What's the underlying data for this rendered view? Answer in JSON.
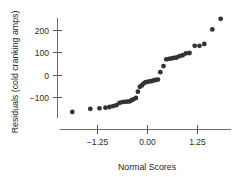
{
  "chart_data": {
    "type": "scatter",
    "title": "",
    "xlabel": "Normal Scores",
    "ylabel": "Residuals (cold cranking amps)",
    "xlim": [
      -2.1,
      1.95
    ],
    "ylim": [
      -230,
      300
    ],
    "grid": false,
    "legend": null,
    "xticks": [
      -1.25,
      0.0,
      1.25
    ],
    "xticklabels": [
      "−1.25",
      "0.00",
      "1.25"
    ],
    "yticks": [
      -100,
      0,
      100,
      200
    ],
    "yticklabels": [
      "−100",
      "0",
      "100",
      "200"
    ],
    "marker": "filled-circle",
    "marker_color": "#333333",
    "points": [
      {
        "x": -1.88,
        "y": -162
      },
      {
        "x": -1.43,
        "y": -148
      },
      {
        "x": -1.2,
        "y": -146
      },
      {
        "x": -1.05,
        "y": -143
      },
      {
        "x": -0.95,
        "y": -140
      },
      {
        "x": -0.86,
        "y": -136
      },
      {
        "x": -0.78,
        "y": -132
      },
      {
        "x": -0.7,
        "y": -122
      },
      {
        "x": -0.63,
        "y": -118
      },
      {
        "x": -0.57,
        "y": -117
      },
      {
        "x": -0.51,
        "y": -116
      },
      {
        "x": -0.45,
        "y": -115
      },
      {
        "x": -0.4,
        "y": -110
      },
      {
        "x": -0.35,
        "y": -106
      },
      {
        "x": -0.29,
        "y": -100
      },
      {
        "x": -0.24,
        "y": -72
      },
      {
        "x": -0.19,
        "y": -50
      },
      {
        "x": -0.14,
        "y": -44
      },
      {
        "x": -0.1,
        "y": -36
      },
      {
        "x": -0.05,
        "y": -30
      },
      {
        "x": 0.0,
        "y": -28
      },
      {
        "x": 0.05,
        "y": -26
      },
      {
        "x": 0.1,
        "y": -25
      },
      {
        "x": 0.15,
        "y": -22
      },
      {
        "x": 0.2,
        "y": -20
      },
      {
        "x": 0.26,
        "y": -18
      },
      {
        "x": 0.32,
        "y": 15
      },
      {
        "x": 0.4,
        "y": 42
      },
      {
        "x": 0.47,
        "y": 72
      },
      {
        "x": 0.54,
        "y": 74
      },
      {
        "x": 0.6,
        "y": 76
      },
      {
        "x": 0.66,
        "y": 78
      },
      {
        "x": 0.73,
        "y": 80
      },
      {
        "x": 0.8,
        "y": 86
      },
      {
        "x": 0.88,
        "y": 90
      },
      {
        "x": 0.96,
        "y": 98
      },
      {
        "x": 1.05,
        "y": 100
      },
      {
        "x": 1.18,
        "y": 132
      },
      {
        "x": 1.3,
        "y": 132
      },
      {
        "x": 1.42,
        "y": 140
      },
      {
        "x": 1.62,
        "y": 205
      },
      {
        "x": 1.83,
        "y": 252
      }
    ]
  }
}
